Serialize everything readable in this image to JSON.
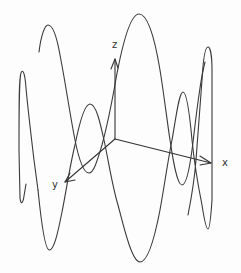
{
  "diagram": {
    "type": "3d-sinusoid-with-axes",
    "colors": {
      "background": "#fdfdfd",
      "stroke": "#3a3a3a",
      "axis": "#333333"
    },
    "axes": {
      "x": {
        "label": "x",
        "from": [
          115,
          139
        ],
        "to": [
          211,
          163
        ]
      },
      "y": {
        "label": "y",
        "from": [
          115,
          139
        ],
        "to": [
          64,
          183
        ]
      },
      "z": {
        "label": "z",
        "from": [
          115,
          139
        ],
        "to": [
          115,
          58
        ]
      }
    },
    "curve_key_points": {
      "left_spike_top": [
        22,
        72
      ],
      "left_spike_bottom": [
        22,
        205
      ],
      "upper_left_peak": [
        48,
        25
      ],
      "lower_left_min": [
        49,
        250
      ],
      "small_left_loop_top": [
        90,
        104
      ],
      "small_left_loop_bottom": [
        89,
        173
      ],
      "big_upper_peak": [
        139,
        14
      ],
      "lower_middle_min": [
        140,
        262
      ],
      "small_right_loop_top": [
        183,
        92
      ],
      "small_right_loop_bottom": [
        182,
        185
      ],
      "right_spike_top": [
        208,
        47
      ],
      "right_spike_bottom": [
        208,
        229
      ]
    }
  }
}
